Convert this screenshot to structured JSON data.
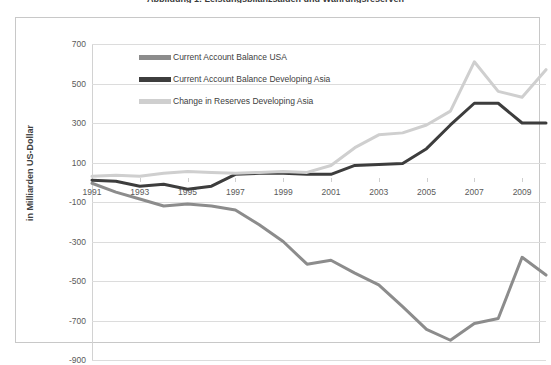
{
  "chart_data": {
    "type": "line",
    "title": "Abbildung 1: Leistungsbilanzsalden und Währungsreserven",
    "xlabel": "",
    "ylabel": "in Milliarden US-Dollar",
    "ylim": [
      -900,
      700
    ],
    "ytick_step": 200,
    "yticks": [
      "700",
      "500",
      "300",
      "100",
      "-100",
      "-300",
      "-500",
      "-700",
      "-900"
    ],
    "xticks": [
      "1991",
      "1993",
      "1995",
      "1997",
      "1999",
      "2001",
      "2003",
      "2005",
      "2007",
      "2009"
    ],
    "x": [
      1991,
      1992,
      1993,
      1994,
      1995,
      1996,
      1997,
      1998,
      1999,
      2000,
      2001,
      2002,
      2003,
      2004,
      2005,
      2006,
      2007,
      2008,
      2009,
      2010
    ],
    "xlim": [
      1991,
      2010
    ],
    "grid": true,
    "legend_position": "upper-left-inside",
    "series": [
      {
        "name": "Current Account Balance USA",
        "color": "#8c8c8c",
        "values": [
          -5,
          -50,
          -85,
          -120,
          -110,
          -120,
          -140,
          -215,
          -300,
          -415,
          -395,
          -460,
          -520,
          -630,
          -745,
          -800,
          -715,
          -690,
          -380,
          -470
        ]
      },
      {
        "name": "Current Account Balance Developing Asia",
        "color": "#3d3d3d",
        "values": [
          10,
          5,
          -20,
          -10,
          -35,
          -20,
          40,
          45,
          45,
          40,
          40,
          85,
          90,
          95,
          170,
          290,
          400,
          400,
          300,
          300
        ]
      },
      {
        "name": "Change in Reserves Developing Asia",
        "color": "#cfcfcf",
        "values": [
          30,
          35,
          30,
          45,
          55,
          50,
          45,
          50,
          55,
          50,
          85,
          175,
          240,
          250,
          290,
          360,
          610,
          460,
          430,
          570
        ]
      }
    ]
  }
}
